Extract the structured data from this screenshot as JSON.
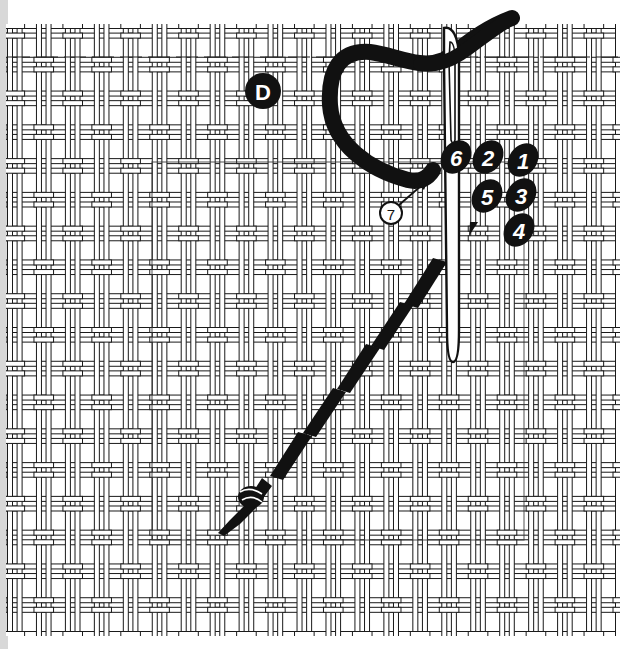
{
  "figure": {
    "label": "D",
    "type": "needlepoint stitch diagram",
    "canvas": {
      "style": "double-thread woven mesh",
      "columns": 21,
      "rows": 18,
      "background": "#ffffff",
      "thread_color": "#1a1a1a"
    },
    "stitch_sequence": {
      "numbers": [
        "1",
        "2",
        "3",
        "4",
        "5",
        "6"
      ],
      "callout": "7",
      "fill": "#111111",
      "text": "#ffffff"
    },
    "elements": {
      "needle": "needle-icon",
      "yarn": "yarn-strand",
      "tail_knot": "knot-icon",
      "worked_stitches": "diagonal tent stitches"
    }
  }
}
